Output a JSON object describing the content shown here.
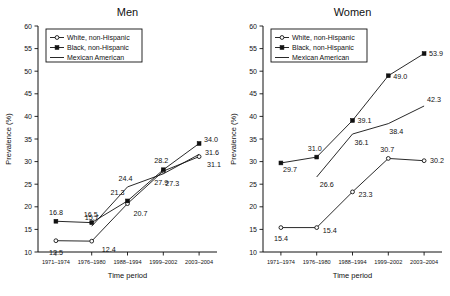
{
  "figure": {
    "xlabel": "Time period",
    "ylabel": "Prevalence (%)",
    "ytick_labels": [
      "60",
      "55",
      "50",
      "45",
      "40",
      "35",
      "30",
      "25",
      "20",
      "15",
      "10"
    ],
    "xtick_labels": [
      "1971–1974",
      "1976–1980",
      "1988–1994",
      "1999–2002",
      "2003–2004"
    ],
    "legend": {
      "white": "White, non-Hispanic",
      "black": "Black, non-Hispanic",
      "mexican": "Mexican American"
    }
  },
  "chart_data": [
    {
      "type": "line",
      "title": "Men",
      "xlabel": "Time period",
      "ylabel": "Prevalence (%)",
      "ylim": [
        10,
        60
      ],
      "ytick_step": 5,
      "grid": false,
      "legend_position": "top-left",
      "categories": [
        "1971–1974",
        "1976–1980",
        "1988–1994",
        "1999–2002",
        "2003–2004"
      ],
      "series": [
        {
          "name": "White, non-Hispanic",
          "marker": "open-circle",
          "values": [
            12.5,
            12.4,
            20.7,
            27.9,
            31.1
          ],
          "labels": [
            "12.5",
            "12.4",
            "20.7",
            "27.9",
            "31.1"
          ]
        },
        {
          "name": "Black, non-Hispanic",
          "marker": "filled-square",
          "values": [
            16.8,
            16.5,
            21.3,
            28.2,
            34.0
          ],
          "labels": [
            "16.8",
            "16.5",
            "21.3",
            "28.2",
            "34.0"
          ]
        },
        {
          "name": "Mexican American",
          "marker": "none",
          "values": [
            null,
            15.7,
            24.4,
            27.3,
            31.6
          ],
          "labels": [
            null,
            "15.7",
            "24.4",
            "27.3",
            "31.6"
          ]
        }
      ]
    },
    {
      "type": "line",
      "title": "Women",
      "xlabel": "Time period",
      "ylabel": "Prevalence (%)",
      "ylim": [
        10,
        60
      ],
      "ytick_step": 5,
      "grid": false,
      "legend_position": "top-left",
      "categories": [
        "1971–1974",
        "1976–1980",
        "1988–1994",
        "1999–2002",
        "2003–2004"
      ],
      "series": [
        {
          "name": "White, non-Hispanic",
          "marker": "open-circle",
          "values": [
            15.4,
            15.4,
            23.3,
            30.7,
            30.2
          ],
          "labels": [
            "15.4",
            "15.4",
            "23.3",
            "30.7",
            "30.2"
          ]
        },
        {
          "name": "Black, non-Hispanic",
          "marker": "filled-square",
          "values": [
            29.7,
            31.0,
            39.1,
            49.0,
            53.9
          ],
          "labels": [
            "29.7",
            "31.0",
            "39.1",
            "49.0",
            "53.9"
          ]
        },
        {
          "name": "Mexican American",
          "marker": "none",
          "values": [
            null,
            26.6,
            36.1,
            38.4,
            42.3
          ],
          "labels": [
            null,
            "26.6",
            "36.1",
            "38.4",
            "42.3"
          ]
        }
      ]
    }
  ]
}
